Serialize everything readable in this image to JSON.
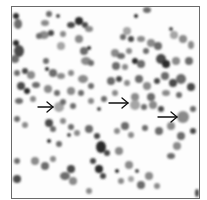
{
  "figure": {
    "type": "micrograph",
    "frame_color": "#6a6a6a",
    "background_color": "#fdfdfd",
    "cell_colors": [
      "#4a4a4a",
      "#6c6c6c",
      "#8a8a8a",
      "#a5a5a5",
      "#2a2a2a"
    ]
  },
  "annotations": {
    "arrows": [
      {
        "id": "arrow-1",
        "direction": "right",
        "x1": 38,
        "y1": 107,
        "x2": 53,
        "y2": 107
      },
      {
        "id": "arrow-2",
        "direction": "right",
        "x1": 109,
        "y1": 103,
        "x2": 128,
        "y2": 103
      },
      {
        "id": "arrow-3",
        "direction": "right",
        "x1": 158,
        "y1": 117,
        "x2": 177,
        "y2": 117
      }
    ],
    "arrow_color": "#111111"
  }
}
